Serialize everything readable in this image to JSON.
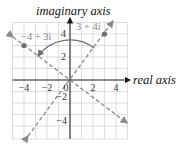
{
  "diagram": {
    "axes": {
      "x_label": "real axis",
      "y_label": "imaginary axis",
      "x_ticks": [
        {
          "value": -4,
          "label": "−4"
        },
        {
          "value": -2,
          "label": "−2"
        },
        {
          "value": 0,
          "label": "0"
        },
        {
          "value": 2,
          "label": "2"
        },
        {
          "value": 4,
          "label": "4"
        }
      ],
      "y_ticks": [
        {
          "value": 4,
          "label": "4"
        },
        {
          "value": 2,
          "label": "2"
        },
        {
          "value": -2,
          "label": "−2"
        },
        {
          "value": -4,
          "label": "−4"
        }
      ],
      "range": {
        "x": [
          -5,
          5
        ],
        "y": [
          -5,
          5
        ]
      },
      "grid": true
    },
    "points": [
      {
        "label": "3 + 4i",
        "re": 3,
        "im": 4
      },
      {
        "label": "−4 + 3i",
        "re": -4,
        "im": 3
      }
    ],
    "lines": [
      {
        "name": "line-through-3+4i",
        "slope": 1.3333,
        "style": "dashed"
      },
      {
        "name": "line-through--4+3i",
        "slope": -0.75,
        "style": "dashed"
      }
    ],
    "arc": {
      "from": "3 + 4i",
      "to": "−4 + 3i",
      "radius_units": 3.5,
      "direction": "counterclockwise"
    },
    "colors": {
      "grid": "#c8c8c8",
      "axis": "#1a1a1a",
      "dashed": "#8a8a8a",
      "point": "#6e6e6e"
    }
  }
}
